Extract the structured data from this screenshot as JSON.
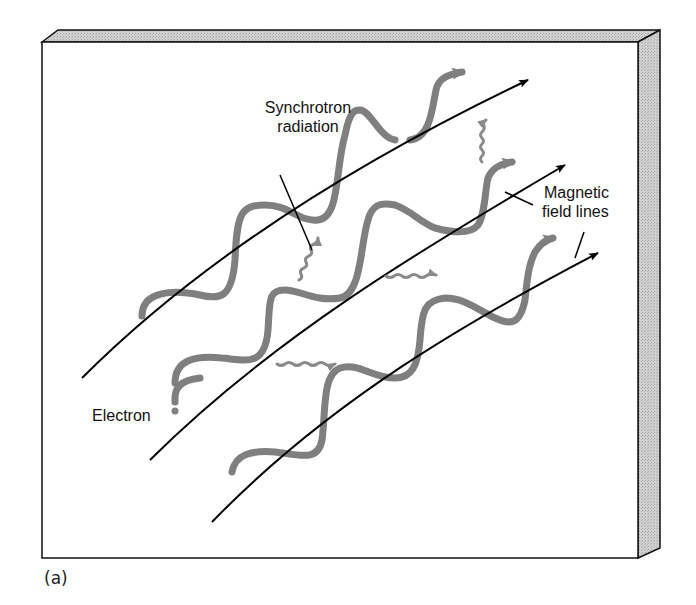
{
  "labels": {
    "synchrotron_line1": "Synchrotron",
    "synchrotron_line2": "radiation",
    "magnetic_line1": "Magnetic",
    "magnetic_line2": "field lines",
    "electron": "Electron"
  },
  "caption": "(a)",
  "colors": {
    "panel_face": "#ffffff",
    "panel_edge": "#c9c9c9",
    "outline": "#111111",
    "electron_path": "#7f7f7f",
    "photon": "#8a8a8a",
    "field_line": "#000000"
  },
  "elements": {
    "field_lines": 3,
    "electron_helices": 3,
    "photon_arrows": 5
  }
}
